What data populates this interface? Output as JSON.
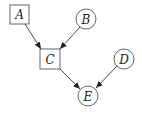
{
  "diagram": {
    "type": "directed-graph",
    "nodes": [
      {
        "id": "A",
        "label": "A",
        "shape": "square"
      },
      {
        "id": "B",
        "label": "B",
        "shape": "circle"
      },
      {
        "id": "C",
        "label": "C",
        "shape": "square"
      },
      {
        "id": "D",
        "label": "D",
        "shape": "circle"
      },
      {
        "id": "E",
        "label": "E",
        "shape": "circle"
      }
    ],
    "edges": [
      {
        "from": "A",
        "to": "C"
      },
      {
        "from": "B",
        "to": "C"
      },
      {
        "from": "C",
        "to": "E"
      },
      {
        "from": "D",
        "to": "E"
      }
    ],
    "colors": {
      "stroke": "#555555",
      "arrow": "#222222",
      "background": "#ffffff"
    }
  }
}
